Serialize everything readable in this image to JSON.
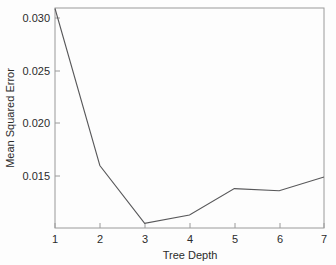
{
  "chart_data": {
    "type": "line",
    "title": "",
    "xlabel": "Tree Depth",
    "ylabel": "Mean Squared Error",
    "x": [
      1,
      2,
      3,
      4,
      5,
      6,
      7
    ],
    "values": [
      0.0309,
      0.016,
      0.0105,
      0.0113,
      0.0138,
      0.0136,
      0.0149
    ],
    "series": [
      {
        "name": "Mean Squared Error",
        "values": [
          0.0309,
          0.016,
          0.0105,
          0.0113,
          0.0138,
          0.0136,
          0.0149
        ]
      }
    ],
    "xlim": [
      1,
      7
    ],
    "ylim": [
      0.0105,
      0.0309
    ],
    "xticks": [
      1,
      2,
      3,
      4,
      5,
      6,
      7
    ],
    "xtick_labels": [
      "1",
      "2",
      "3",
      "4",
      "5",
      "6",
      "7"
    ],
    "yticks": [
      0.015,
      0.02,
      0.025,
      0.03
    ],
    "ytick_labels": [
      "0.015",
      "0.020",
      "0.025",
      "0.030"
    ],
    "grid": false,
    "legend": null,
    "line_color": "#58585a",
    "axis_color": "#9a9a9a",
    "background_color": "#fdfdfd"
  }
}
